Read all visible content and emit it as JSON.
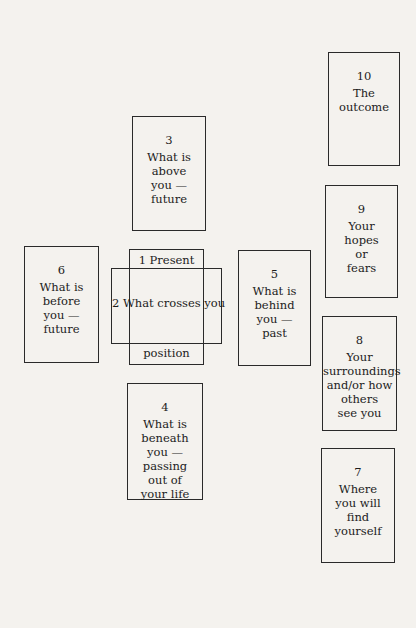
{
  "diagram": {
    "title": "",
    "cards": {
      "c10": {
        "number": "10",
        "lines": [
          "The",
          "outcome"
        ]
      },
      "c3": {
        "number": "3",
        "lines": [
          "What is",
          "above",
          "you —",
          "future"
        ]
      },
      "c9": {
        "number": "9",
        "lines": [
          "Your",
          "hopes",
          "or",
          "fears"
        ]
      },
      "c6": {
        "number": "6",
        "lines": [
          "What is",
          "before",
          "you —",
          "future"
        ]
      },
      "c1": {
        "top_label": "1  Present",
        "bottom_label": "position"
      },
      "c2": {
        "label": "2 What crosses you"
      },
      "c5": {
        "number": "5",
        "lines": [
          "What is",
          "behind",
          "you —",
          "past"
        ]
      },
      "c8": {
        "number": "8",
        "lines": [
          "Your",
          "surroundings",
          "and/or how",
          "others",
          "see you"
        ]
      },
      "c4": {
        "number": "4",
        "lines": [
          "What is",
          "beneath",
          "you —",
          "passing",
          "out of",
          "your life"
        ]
      },
      "c7": {
        "number": "7",
        "lines": [
          "Where",
          "you will",
          "find",
          "yourself"
        ]
      }
    }
  }
}
